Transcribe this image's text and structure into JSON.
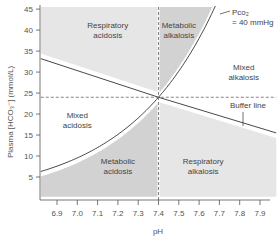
{
  "chart_data": {
    "type": "line",
    "title": "",
    "xlabel": "pH",
    "ylabel": "Plasma [HCO₃⁻] (mmol/L)",
    "xlim": [
      6.82,
      7.98
    ],
    "ylim": [
      0,
      46
    ],
    "x_ticks": [
      6.9,
      7.0,
      7.1,
      7.2,
      7.3,
      7.4,
      7.5,
      7.6,
      7.7,
      7.8,
      7.9
    ],
    "x_tick_labels": [
      "6.9",
      "7.0",
      "7.1",
      "7.2",
      "7.3",
      "7.4",
      "7.5",
      "7.6",
      "7.7",
      "7.8",
      "7.9"
    ],
    "y_ticks": [
      5,
      10,
      15,
      20,
      25,
      30,
      35,
      40,
      45
    ],
    "y_tick_labels": [
      "5",
      "10",
      "15",
      "20",
      "25",
      "30",
      "35",
      "40",
      "45"
    ],
    "grid": false,
    "normal_point": {
      "pH": 7.4,
      "hco3": 24
    },
    "series": [
      {
        "name": "Pco₂ = 40 mmHg",
        "kind": "isobar",
        "formula": "HCO3 = 24 * 10^(pH - 7.4)",
        "x": [
          6.82,
          6.9,
          7.0,
          7.1,
          7.2,
          7.3,
          7.4,
          7.5,
          7.6,
          7.65
        ],
        "y": [
          6.3,
          7.6,
          9.6,
          12.0,
          15.1,
          19.1,
          24.0,
          30.2,
          38.0,
          42.7
        ]
      },
      {
        "name": "Buffer line",
        "kind": "line",
        "x": [
          6.82,
          7.4,
          7.98
        ],
        "y": [
          33.2,
          24.0,
          15.5
        ]
      },
      {
        "name": "Normal pH",
        "kind": "dashed-vertical",
        "x": [
          7.4,
          7.4
        ],
        "y": [
          0,
          46
        ]
      },
      {
        "name": "Normal HCO3",
        "kind": "dashed-horizontal",
        "x": [
          6.82,
          7.98
        ],
        "y": [
          24,
          24
        ]
      }
    ],
    "regions": [
      {
        "label_line1": "Respiratory",
        "label_line2": "acidosis",
        "shade": "light",
        "at": {
          "pH": 7.15,
          "hco3": 40.5
        }
      },
      {
        "label_line1": "Metabolic",
        "label_line2": "alkalosis",
        "shade": "dark",
        "at": {
          "pH": 7.5,
          "hco3": 40.5
        }
      },
      {
        "label_line1": "Mixed",
        "label_line2": "alkalosis",
        "shade": "none",
        "at": {
          "pH": 7.82,
          "hco3": 30.5
        }
      },
      {
        "label_line1": "Mixed",
        "label_line2": "acidosis",
        "shade": "none",
        "at": {
          "pH": 7.0,
          "hco3": 19
        }
      },
      {
        "label_line1": "Metabolic",
        "label_line2": "acidosis",
        "shade": "dark",
        "at": {
          "pH": 7.2,
          "hco3": 8
        }
      },
      {
        "label_line1": "Respiratory",
        "label_line2": "alkalosis",
        "shade": "light",
        "at": {
          "pH": 7.62,
          "hco3": 8
        }
      }
    ],
    "annotations": [
      {
        "text_line1": "Pco₂",
        "text_line2": "= 40 mmHg",
        "target": "isobar"
      },
      {
        "text_line1": "Buffer line",
        "text_line2": "",
        "target": "buffer"
      }
    ],
    "colors": {
      "light_region": "#e6e6e6",
      "dark_region": "#d2d2d2",
      "line": "#333333",
      "dashed": "#666666",
      "axis": "#555555"
    }
  }
}
